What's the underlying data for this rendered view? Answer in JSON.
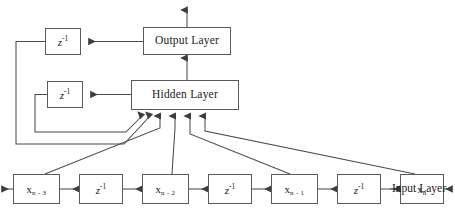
{
  "diagram": {
    "background_color": "#ffffff",
    "line_color": "#4a4a4a",
    "box_border_color": "#5a5a5a",
    "text_color": "#1a1a1a",
    "width": 455,
    "height": 212
  },
  "layers": {
    "output": {
      "label": "Output Layer",
      "x": 143,
      "y": 27,
      "w": 88,
      "h": 28
    },
    "hidden": {
      "label": "Hidden Layer",
      "x": 131,
      "y": 80,
      "w": 108,
      "h": 30
    }
  },
  "feedback_delays": [
    {
      "name": "output-feedback-delay",
      "label": "z",
      "exponent": "-1",
      "x": 45,
      "y": 28,
      "w": 36,
      "h": 27
    },
    {
      "name": "hidden-feedback-delay",
      "label": "z",
      "exponent": "-1",
      "x": 47,
      "y": 81,
      "w": 36,
      "h": 27
    }
  ],
  "input_chain": [
    {
      "name": "tap-x-n-3",
      "type": "tap",
      "symbol": "x",
      "subscript": "n - 3",
      "x": 13,
      "y": 174,
      "w": 47,
      "h": 30
    },
    {
      "name": "delay-3",
      "type": "delay",
      "label": "z",
      "exponent": "-1",
      "x": 79,
      "y": 174,
      "w": 44,
      "h": 30
    },
    {
      "name": "tap-x-n-2",
      "type": "tap",
      "symbol": "x",
      "subscript": "n - 2",
      "x": 142,
      "y": 174,
      "w": 47,
      "h": 30
    },
    {
      "name": "delay-2",
      "type": "delay",
      "label": "z",
      "exponent": "-1",
      "x": 208,
      "y": 174,
      "w": 44,
      "h": 30
    },
    {
      "name": "tap-x-n-1",
      "type": "tap",
      "symbol": "x",
      "subscript": "n - 1",
      "x": 271,
      "y": 174,
      "w": 47,
      "h": 30
    },
    {
      "name": "delay-1",
      "type": "delay",
      "label": "z",
      "exponent": "-1",
      "x": 337,
      "y": 174,
      "w": 44,
      "h": 30
    },
    {
      "name": "tap-x-n",
      "type": "tap",
      "symbol": "x",
      "subscript": "n",
      "x": 400,
      "y": 174,
      "w": 44,
      "h": 30
    }
  ],
  "annotations": {
    "input_layer_label": "Input Layer"
  }
}
